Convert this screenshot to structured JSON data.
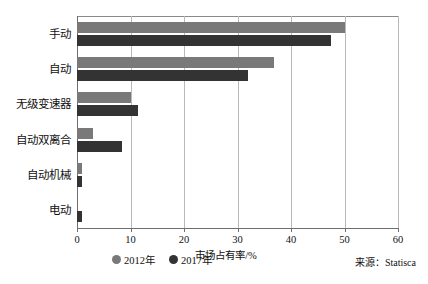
{
  "chart_data": {
    "type": "bar",
    "orientation": "horizontal",
    "title": "",
    "xlabel": "市场占有率/%",
    "ylabel": "",
    "xlim": [
      0,
      60
    ],
    "xticks": [
      0,
      10,
      20,
      30,
      40,
      50,
      60
    ],
    "grid": true,
    "legend_position": "bottom",
    "categories": [
      "手动",
      "自动",
      "无级变速器",
      "自动双离合",
      "自动机械",
      "电动"
    ],
    "series": [
      {
        "name": "2012年",
        "color": "#797979",
        "values": [
          50.0,
          36.8,
          10.0,
          3.0,
          1.0,
          0.0
        ]
      },
      {
        "name": "2017年",
        "color": "#333333",
        "values": [
          47.5,
          32.0,
          11.4,
          8.4,
          1.0,
          1.0
        ]
      }
    ],
    "source": "来源：Statisca"
  },
  "axis": {
    "tick_labels": [
      "0",
      "10",
      "20",
      "30",
      "40",
      "50",
      "60"
    ],
    "x_title": "市场占有率/%"
  },
  "legend": {
    "items": [
      {
        "label": "2012年",
        "color": "#797979"
      },
      {
        "label": "2017年",
        "color": "#333333"
      }
    ]
  },
  "footer": {
    "source": "来源：Statisca"
  }
}
